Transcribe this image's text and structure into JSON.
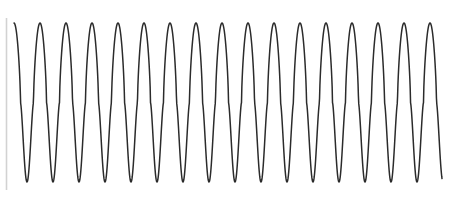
{
  "figure": {
    "width": 450,
    "height": 199,
    "background_color": "#ffffff",
    "title": "",
    "xlabel": "",
    "ylabel": ""
  },
  "axis": {
    "y_axis_visible": true,
    "y_axis_color": "#d2d2d2",
    "y_axis_width": 1.6,
    "y_axis_x": 6.5,
    "y_axis_top": 18,
    "y_axis_bottom": 190,
    "x_axis_visible": false,
    "grid": false,
    "tick_labels_visible": false
  },
  "curve": {
    "color": "#2b2b2b",
    "width": 1.5,
    "x_start": 14,
    "x_end": 442,
    "y_peak": 23,
    "y_trough": 182,
    "period_px": 26.0,
    "cycles_visible": 17
  },
  "chart_data": {
    "type": "line",
    "title": "",
    "xlabel": "",
    "ylabel": "",
    "xlim": [
      0,
      450
    ],
    "ylim": [
      -1.08,
      1.08
    ],
    "grid": false,
    "legend": null,
    "legend_position": "none",
    "tick_labels": {
      "x": [],
      "y": []
    },
    "series": [
      {
        "name": "oscillation",
        "color": "#2b2b2b",
        "description": "high-frequency asymmetric oscillation: broad rounded crests near the top, narrow sharp troughs near the bottom",
        "waveform": {
          "shape": "asymmetric-sinusoid",
          "period_px": 26.0,
          "phase_offset_px": 14.0,
          "crest_flatness": 0.55,
          "trough_sharpness": 2.6,
          "amplitude_norm": 1.0
        },
        "cycle_count": 17,
        "peak_x_px": [
          36,
          63,
          89,
          115,
          141,
          167,
          193,
          219,
          224,
          250,
          276,
          302,
          328,
          337,
          363,
          389,
          415,
          441
        ],
        "trough_x_px": [
          21,
          49,
          75,
          101,
          128,
          154,
          180,
          206,
          232,
          258,
          284,
          310,
          336,
          362,
          388,
          414,
          440
        ],
        "peak_y_px": 23,
        "trough_y_px": 182,
        "y_values_normalized": [
          1,
          -1,
          1,
          -1,
          1,
          -1,
          1,
          -1,
          1,
          -1,
          1,
          -1,
          1,
          -1,
          1,
          -1,
          1,
          -1,
          1,
          -1,
          1,
          -1,
          1,
          -1,
          1,
          -1,
          1,
          -1,
          1,
          -1,
          1,
          -1,
          1,
          -1,
          1
        ]
      }
    ]
  }
}
